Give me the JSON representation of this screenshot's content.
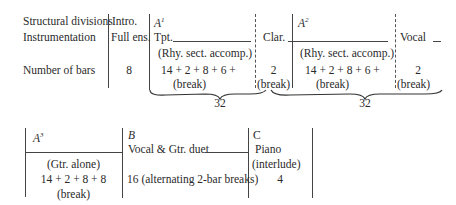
{
  "top_table": {
    "row_labels": {
      "structural": "Structural divisions",
      "instrumentation": "Instrumentation",
      "bars": "Number of bars"
    },
    "intro": {
      "heading": "Intro.",
      "instrumentation": "Full ens.",
      "bars": "8"
    },
    "a1": {
      "heading": "A",
      "heading_sup": "1",
      "instrumentation": "Tpt.",
      "accomp": "(Rhy. sect. accomp.)",
      "bars": "14 +  2 +  8 +  6 +",
      "break": "(break)"
    },
    "clar": {
      "instrumentation": "Clar.",
      "bars": "2",
      "break": "(break)"
    },
    "a2": {
      "heading": "A",
      "heading_sup": "2",
      "accomp": "(Rhy. sect. accomp.)",
      "bars": "14 +  2 +  8 +  6 +",
      "break": "(break)"
    },
    "vocal": {
      "instrumentation": "Vocal",
      "bars": "2",
      "break": "(break)"
    },
    "brace_totals": [
      "32",
      "32"
    ]
  },
  "bottom_table": {
    "a3": {
      "heading": "A",
      "heading_sup": "3",
      "instrumentation": "(Gtr. alone)",
      "bars": "14 +  2 +  8 + 8",
      "break": "(break)"
    },
    "b": {
      "heading": "B",
      "instrumentation": "Vocal & Gtr. duet",
      "bars": "16 (alternating 2-bar breaks)"
    },
    "c": {
      "heading": "C",
      "instrumentation": "Piano",
      "instrumentation2": "(interlude)",
      "bars": "4"
    }
  }
}
